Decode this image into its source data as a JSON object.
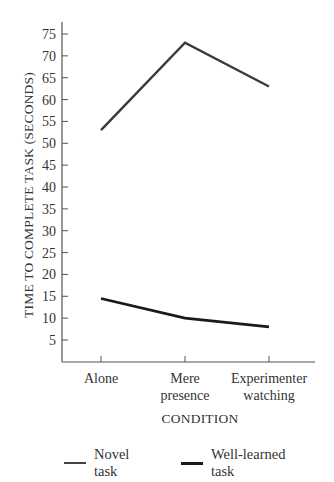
{
  "chart_data": {
    "type": "line",
    "title": "",
    "xlabel": "CONDITION",
    "ylabel": "TIME TO COMPLETE TASK (SECONDS)",
    "categories": [
      "Alone",
      "Mere presence",
      "Experimenter watching"
    ],
    "category_lines": [
      [
        "Alone"
      ],
      [
        "Mere",
        "presence"
      ],
      [
        "Experimenter",
        "watching"
      ]
    ],
    "series": [
      {
        "name": "Novel task",
        "values": [
          53,
          73,
          63
        ],
        "color": "#3a3a3a"
      },
      {
        "name": "Well-learned task",
        "values": [
          14.5,
          10,
          8
        ],
        "color": "#1a1a1a"
      }
    ],
    "yticks": [
      5,
      10,
      15,
      20,
      25,
      30,
      35,
      40,
      45,
      50,
      55,
      60,
      65,
      70,
      75
    ],
    "ylim": [
      0,
      77
    ],
    "grid": false,
    "legend_position": "bottom"
  },
  "legend": {
    "items": [
      {
        "label": "Novel task"
      },
      {
        "label": "Well-learned task"
      }
    ]
  }
}
